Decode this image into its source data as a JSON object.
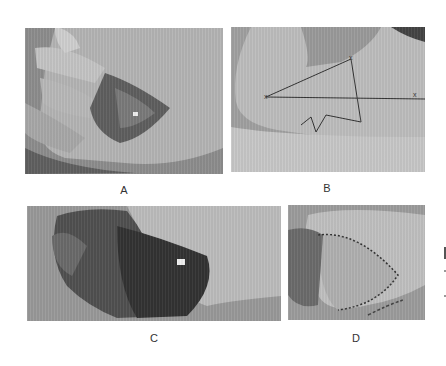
{
  "figure": {
    "panels": [
      {
        "id": "A",
        "label": "A",
        "description": "Palm of hand with central burn wound"
      },
      {
        "id": "B",
        "label": "B",
        "description": "Forearm with triangular flap outlined in marker"
      },
      {
        "id": "C",
        "label": "C",
        "description": "Hand with extensive debrided wound"
      },
      {
        "id": "D",
        "label": "D",
        "description": "Hand after flap coverage with sutures"
      }
    ]
  }
}
